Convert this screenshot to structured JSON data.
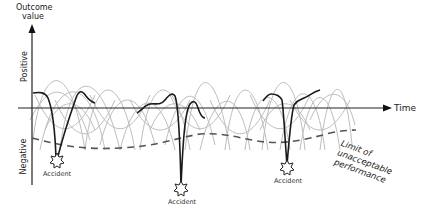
{
  "diagram": {
    "y_axis": {
      "title_line1": "Outcome",
      "title_line2": "value",
      "positive_label": "Positive",
      "negative_label": "Negative"
    },
    "x_axis": {
      "title": "Time"
    },
    "limit_label": {
      "line1": "Limit of",
      "line2": "unacceptable",
      "line3": "performance"
    },
    "accidents": [
      {
        "label": "Accident"
      },
      {
        "label": "Accident"
      },
      {
        "label": "Accident"
      }
    ],
    "colors": {
      "axis": "#222222",
      "variability": "#b8b8b8",
      "trajectory": "#1a1a1a",
      "limit": "#555555"
    }
  }
}
